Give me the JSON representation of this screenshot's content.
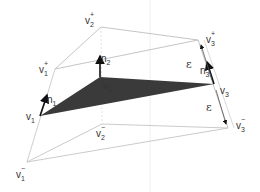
{
  "diagram": {
    "vertices": {
      "v1": {
        "label": "v",
        "sub": "1",
        "sup": ""
      },
      "v2": {
        "label": "v",
        "sub": "2",
        "sup": ""
      },
      "v3": {
        "label": "v",
        "sub": "3",
        "sup": ""
      },
      "v1p": {
        "label": "v",
        "sub": "1",
        "sup": "+"
      },
      "v2p": {
        "label": "v",
        "sub": "2",
        "sup": "+"
      },
      "v3p": {
        "label": "v",
        "sub": "3",
        "sup": "+"
      },
      "v1m": {
        "label": "v",
        "sub": "1",
        "sup": "−"
      },
      "v2m": {
        "label": "v",
        "sub": "2",
        "sup": "−"
      },
      "v3m": {
        "label": "v",
        "sub": "3",
        "sup": "−"
      }
    },
    "normals": {
      "n1": {
        "label": "n",
        "sub": "1"
      },
      "n2": {
        "label": "n",
        "sub": "2"
      },
      "n3": {
        "label": "n",
        "sub": "3"
      }
    },
    "epsilon_upper": "ε",
    "epsilon_lower": "ε",
    "colors": {
      "triangle_fill": "#3a3a3a",
      "edge_line": "#b8b8b8",
      "arrow": "#111111"
    }
  }
}
